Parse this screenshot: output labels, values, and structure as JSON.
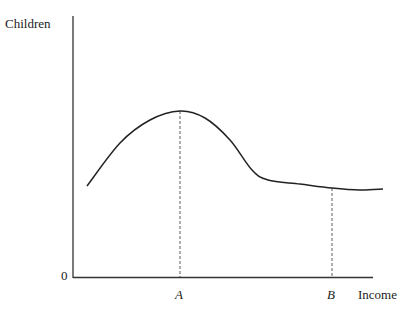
{
  "chart_data": {
    "type": "line",
    "title": "",
    "xlabel": "Income",
    "ylabel": "Children",
    "origin_label": "0",
    "x_markers": [
      {
        "label": "A",
        "x": 180,
        "y": 111,
        "note": "peak of curve"
      },
      {
        "label": "B",
        "x": 332,
        "y": 188
      }
    ],
    "curve_points": [
      [
        87,
        186
      ],
      [
        120,
        143
      ],
      [
        150,
        120
      ],
      [
        180,
        111
      ],
      [
        205,
        118
      ],
      [
        230,
        140
      ],
      [
        252,
        170
      ],
      [
        268,
        180
      ],
      [
        300,
        184
      ],
      [
        332,
        188
      ],
      [
        360,
        190
      ],
      [
        383,
        189
      ]
    ],
    "grid": false,
    "legend": null
  },
  "labels": {
    "y_axis": "Children",
    "x_axis": "Income",
    "origin": "0",
    "marker_a": "A",
    "marker_b": "B"
  }
}
